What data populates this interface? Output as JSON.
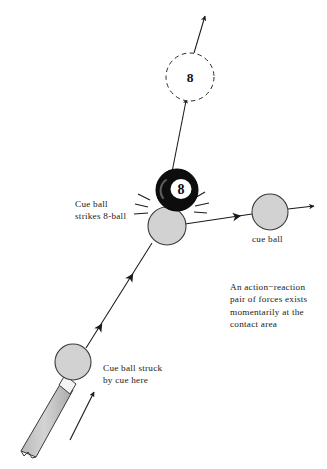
{
  "figure": {
    "background_color": "#ffffff",
    "line_color": "#1a1a1a",
    "ball_fill": "#d2d2d2",
    "eight_ball_fill": "#0d0d0d",
    "cue_stick_fill": "#c9c9c9"
  },
  "captions": {
    "strike": "Cue ball\nstrikes 8-ball",
    "cue_ball": "cue ball",
    "action_reaction": "An action−reaction\npair of forces exists\nmomentarily at the\ncontact area",
    "struck": "Cue ball struck\nby cue here"
  },
  "balls": {
    "eight_ball_future": {
      "label": "8",
      "cx": 190,
      "cy": 77,
      "r": 24,
      "style": "dashed-outline"
    },
    "eight_ball_contact": {
      "label": "8",
      "cx": 177,
      "cy": 190,
      "r": 21,
      "style": "solid-black"
    },
    "cue_ball_contact": {
      "cx": 167,
      "cy": 226,
      "r": 19,
      "style": "gray"
    },
    "cue_ball_after": {
      "cx": 270,
      "cy": 212,
      "r": 18,
      "style": "gray"
    },
    "cue_ball_start": {
      "cx": 73,
      "cy": 362,
      "r": 18,
      "style": "gray"
    }
  },
  "trajectories": {
    "eight_ball_path": "from contact point up-right through dashed ball to top arrow",
    "cue_ball_incoming": "from lower-left start ball up-right to contact",
    "cue_ball_outgoing": "from contact right to cue ball then arrow right",
    "cue_stick_motion": "short arrow parallel to cue stick pointing up-right"
  }
}
